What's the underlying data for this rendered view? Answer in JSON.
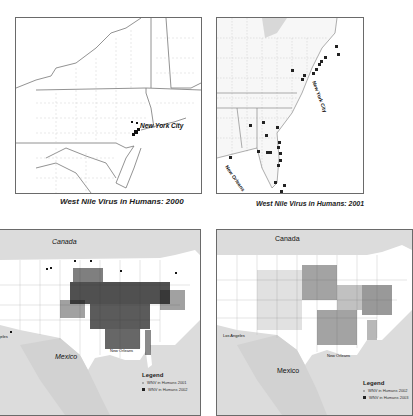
{
  "panels": [
    {
      "id": "2000",
      "caption": "West Nile Virus in Humans: 2000",
      "labels": {
        "city": "New York City"
      }
    },
    {
      "id": "2001",
      "caption": "West Nile Virus in Humans: 2001",
      "labels": {
        "city_ny": "New York City",
        "city_no": "New Orleans"
      }
    },
    {
      "id": "2002",
      "labels": {
        "canada": "Canada",
        "mexico": "Mexico",
        "la": "Los Angeles",
        "no": "New Orleans"
      },
      "legend": {
        "title": "Legend",
        "items": [
          "WNV in Humans 2001",
          "WNV in Humans 2002"
        ]
      }
    },
    {
      "id": "2003",
      "labels": {
        "canada": "Canada",
        "mexico": "Mexico",
        "la": "Los Angeles",
        "no": "New Orleans"
      },
      "legend": {
        "title": "Legend",
        "items": [
          "WNV in Humans 2002",
          "WNV in Humans 2003"
        ]
      }
    }
  ],
  "colors": {
    "land": "#ffffff",
    "water": "#dcdcdc",
    "foreign": "#d4d4d4",
    "case": "#1a1a1a",
    "border": "#6a6a6a"
  }
}
